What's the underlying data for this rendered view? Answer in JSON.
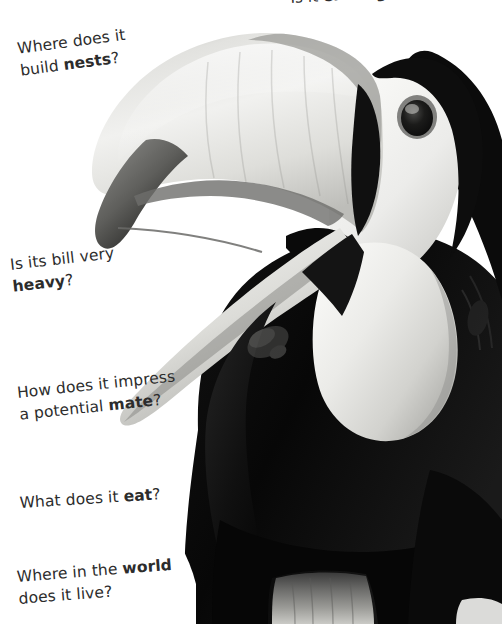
{
  "page": {
    "background_color": "#ffffff",
    "text_color": "#2c2c2c",
    "width": 502,
    "height": 624
  },
  "photo": {
    "subject": "toucan",
    "treatment": "black-and-white photograph",
    "alt": "Close-up black and white photograph of a toucan with a large curved bill, open mandibles, pale throat bib and dark body feathers",
    "palette": {
      "background": "#ffffff",
      "bill_light": "#e9e9e7",
      "bill_mid": "#cfcfcc",
      "bill_shadow": "#9a9a97",
      "bill_tip_dark": "#4a4a48",
      "bill_tip_black": "#1d1d1c",
      "eye_ring": "#6d6d6b",
      "eye_pupil": "#141414",
      "head_pale": "#f2f2f0",
      "throat_bib": "#dcdcd9",
      "body_dark": "#0e0e0e",
      "body_black": "#050505"
    }
  },
  "questions": [
    {
      "id": "endangered",
      "text_plain": "Is it endangered?",
      "lead": "Is it ",
      "emphasis": "endangered",
      "trail": "?",
      "cropped": true,
      "rotation_deg": -3.2
    },
    {
      "id": "nests",
      "line1_lead": "Where does it",
      "line2_lead": "build ",
      "line2_emphasis": "nests",
      "line2_trail": "?",
      "rotation_deg": -7.5
    },
    {
      "id": "heavy",
      "line1_lead": "Is its bill very",
      "line2_lead": "",
      "line2_emphasis": "heavy",
      "line2_trail": "?",
      "rotation_deg": -6.5
    },
    {
      "id": "mate",
      "line1_lead": "How does it impress",
      "line2_lead": "a potential ",
      "line2_emphasis": "mate",
      "line2_trail": "?",
      "rotation_deg": -6
    },
    {
      "id": "eat",
      "line1_lead": "What does it ",
      "line1_emphasis": "eat",
      "line1_trail": "?",
      "rotation_deg": -3.5
    },
    {
      "id": "live",
      "line1_lead": "Where in the ",
      "line1_emphasis": "world",
      "line2_lead": "does it live?",
      "rotation_deg": -4.5
    }
  ]
}
